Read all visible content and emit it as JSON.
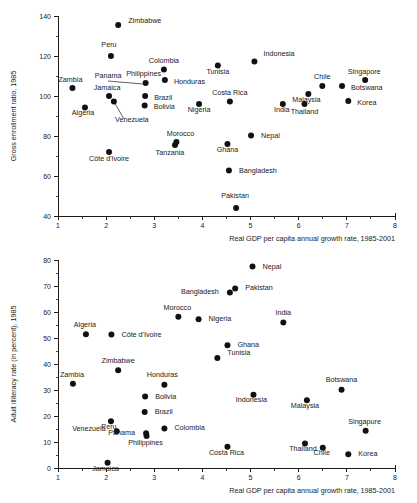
{
  "figure": {
    "background": "#ffffff",
    "marker_color": "#111111",
    "axis_color": "#1a1a1a"
  },
  "chart_data": [
    {
      "id": "top",
      "type": "scatter",
      "title": "",
      "xlabel": "Real GDP per capita annual growth rate, 1985-2001",
      "ylabel": "Gross enrollment ratio, 1985",
      "xlim": [
        1,
        8
      ],
      "ylim": [
        40,
        140
      ],
      "xticks": [
        1,
        2,
        3,
        4,
        5,
        6,
        7,
        8
      ],
      "yticks": [
        40,
        60,
        80,
        100,
        120,
        140
      ],
      "x_minor_step": 0.5,
      "y_minor_step": 10,
      "grid": false,
      "legend": "none",
      "points": [
        {
          "label": "Zimbabwe",
          "x": 2.25,
          "y": 135.5,
          "lx": 10,
          "ly": 2.5
        },
        {
          "label": "Peru",
          "x": 2.1,
          "y": 120.0,
          "lx": -2,
          "ly": 9.0,
          "anchor": "middle"
        },
        {
          "label": "Indonesia",
          "x": 5.08,
          "y": 117.3,
          "lx": 9,
          "ly": 5.0
        },
        {
          "label": "Colombia",
          "x": 3.2,
          "y": 113.2,
          "lx": 0,
          "ly": 7.0,
          "anchor": "middle"
        },
        {
          "label": "Tunisia",
          "x": 4.32,
          "y": 115.3,
          "lx": 0,
          "ly": -8.5,
          "anchor": "middle"
        },
        {
          "label": "Singapore",
          "x": 7.38,
          "y": 108.0,
          "lx": -1,
          "ly": 6.5,
          "anchor": "middle"
        },
        {
          "label": "Philippines",
          "x": 2.82,
          "y": 106.5,
          "lx": -2,
          "ly": 7.0,
          "anchor": "middle"
        },
        {
          "label": "Honduras",
          "x": 3.22,
          "y": 108.0,
          "lx": 9,
          "ly": -4.0
        },
        {
          "label": "Chile",
          "x": 6.49,
          "y": 105.0,
          "lx": 0,
          "ly": 7.0,
          "anchor": "middle"
        },
        {
          "label": "Botswana",
          "x": 6.9,
          "y": 105.0,
          "lx": 9,
          "ly": -4.0
        },
        {
          "label": "Zambia",
          "x": 1.3,
          "y": 104.0,
          "lx": -2,
          "ly": 6.5,
          "anchor": "middle"
        },
        {
          "label": "Malaysia",
          "x": 6.2,
          "y": 101.0,
          "lx": -2,
          "ly": -7.5,
          "anchor": "middle"
        },
        {
          "label": "Jamaica",
          "x": 2.06,
          "y": 100.0,
          "lx": -2,
          "ly": 6.5,
          "anchor": "middle"
        },
        {
          "label": "Brazil",
          "x": 2.81,
          "y": 100.0,
          "lx": 9,
          "ly": -3.5
        },
        {
          "label": "Korea",
          "x": 7.03,
          "y": 97.5,
          "lx": 9,
          "ly": -3.5
        },
        {
          "label": "Costa Rica",
          "x": 4.57,
          "y": 97.3,
          "lx": 0,
          "ly": 6.5,
          "anchor": "middle"
        },
        {
          "label": "Venezuela",
          "x": 2.16,
          "y": 97.2,
          "lx": 18,
          "ly": -20.0,
          "anchor": "middle",
          "leader": true
        },
        {
          "label": "Nigeria",
          "x": 3.93,
          "y": 96.0,
          "lx": 0,
          "ly": -7.5,
          "anchor": "middle"
        },
        {
          "label": "India",
          "x": 5.67,
          "y": 96.0,
          "lx": -1,
          "ly": -7.5,
          "anchor": "middle"
        },
        {
          "label": "Thailand",
          "x": 6.12,
          "y": 96.0,
          "lx": 0,
          "ly": -9.5,
          "anchor": "middle"
        },
        {
          "label": "Bolivia",
          "x": 2.8,
          "y": 95.2,
          "lx": 9,
          "ly": -3.5
        },
        {
          "label": "Algeria",
          "x": 1.56,
          "y": 94.2,
          "lx": -2,
          "ly": -7.5,
          "anchor": "middle"
        },
        {
          "label": "Nepal",
          "x": 5.01,
          "y": 80.3,
          "lx": 10,
          "ly": -2.5
        },
        {
          "label": "Morocco",
          "x": 3.46,
          "y": 77.0,
          "lx": 4,
          "ly": 6.5,
          "anchor": "middle"
        },
        {
          "label": "Ghana",
          "x": 4.52,
          "y": 76.0,
          "lx": 0,
          "ly": -8.0,
          "anchor": "middle"
        },
        {
          "label": "Tanzania",
          "x": 3.43,
          "y": 75.5,
          "lx": -5,
          "ly": -9.5,
          "anchor": "middle"
        },
        {
          "label": "Côte d'Ivoire",
          "x": 2.06,
          "y": 72.0,
          "lx": 0,
          "ly": -9.0,
          "anchor": "middle"
        },
        {
          "label": "Bangladesh",
          "x": 4.55,
          "y": 62.7,
          "lx": 10,
          "ly": -2.5
        },
        {
          "label": "Pakistan",
          "x": 4.7,
          "y": 44.0,
          "lx": -1,
          "ly": 10.0,
          "anchor": "middle"
        }
      ],
      "panama_leader": {
        "from_x": 2.04,
        "from_y": 107.5,
        "to_x": 2.76,
        "to_y": 106.0
      }
    },
    {
      "id": "bottom",
      "type": "scatter",
      "title": "",
      "xlabel": "Real GDP per capita annual growth rate, 1985-2001",
      "ylabel": "Adult illiteracy rate (in percent), 1985",
      "xlim": [
        1,
        8
      ],
      "ylim": [
        0,
        80
      ],
      "xticks": [
        1,
        2,
        3,
        4,
        5,
        6,
        7,
        8
      ],
      "yticks": [
        0,
        10,
        20,
        30,
        40,
        50,
        60,
        70,
        80
      ],
      "x_minor_step": 0.5,
      "y_minor_step": 5,
      "grid": false,
      "legend": "none",
      "points": [
        {
          "label": "Nepal",
          "x": 5.04,
          "y": 77.5,
          "lx": 10,
          "ly": -2.5
        },
        {
          "label": "Pakistan",
          "x": 4.68,
          "y": 69.0,
          "lx": 10,
          "ly": -1.5
        },
        {
          "label": "Bangladesh",
          "x": 4.57,
          "y": 67.5,
          "lx": -11,
          "ly": -1.0,
          "anchor": "end"
        },
        {
          "label": "Morocco",
          "x": 3.5,
          "y": 58.2,
          "lx": -1,
          "ly": 6.5,
          "anchor": "middle"
        },
        {
          "label": "Nigeria",
          "x": 3.92,
          "y": 57.2,
          "lx": 10,
          "ly": -2.0
        },
        {
          "label": "India",
          "x": 5.68,
          "y": 56.0,
          "lx": 0,
          "ly": 7.5,
          "anchor": "middle"
        },
        {
          "label": "Algeria",
          "x": 1.58,
          "y": 51.4,
          "lx": -1,
          "ly": 7.0,
          "anchor": "middle"
        },
        {
          "label": "Côte d'Ivoire",
          "x": 2.11,
          "y": 51.3,
          "lx": 10,
          "ly": -2.0
        },
        {
          "label": "Ghana",
          "x": 4.52,
          "y": 47.2,
          "lx": 10,
          "ly": -2.0
        },
        {
          "label": "Tunisia",
          "x": 4.31,
          "y": 42.3,
          "lx": 10,
          "ly": 3.5
        },
        {
          "label": "Zimbabwe",
          "x": 2.25,
          "y": 37.6,
          "lx": 0,
          "ly": 7.0,
          "anchor": "middle"
        },
        {
          "label": "Zambia",
          "x": 1.31,
          "y": 32.4,
          "lx": -1,
          "ly": 7.0,
          "anchor": "middle"
        },
        {
          "label": "Honduras",
          "x": 3.21,
          "y": 32.0,
          "lx": -2,
          "ly": 7.5,
          "anchor": "middle"
        },
        {
          "label": "Botswana",
          "x": 6.89,
          "y": 30.1,
          "lx": 0,
          "ly": 7.5,
          "anchor": "middle"
        },
        {
          "label": "Indonesia",
          "x": 5.06,
          "y": 28.2,
          "lx": -2,
          "ly": -7.5,
          "anchor": "middle"
        },
        {
          "label": "Bolivia",
          "x": 2.81,
          "y": 27.5,
          "lx": 10,
          "ly": -2.0
        },
        {
          "label": "Malaysia",
          "x": 6.17,
          "y": 26.1,
          "lx": -2,
          "ly": -7.5,
          "anchor": "middle"
        },
        {
          "label": "Brazil",
          "x": 2.8,
          "y": 21.5,
          "lx": 10,
          "ly": -2.0
        },
        {
          "label": "Peru",
          "x": 2.1,
          "y": 18.0,
          "lx": -2,
          "ly": -7.5,
          "anchor": "middle"
        },
        {
          "label": "Colombia",
          "x": 3.21,
          "y": 15.2,
          "lx": 10,
          "ly": -2.0
        },
        {
          "label": "Singapure",
          "x": 7.39,
          "y": 14.3,
          "lx": -1,
          "ly": 7.0,
          "anchor": "middle"
        },
        {
          "label": "Venezuela",
          "x": 2.22,
          "y": 14.1,
          "lx": -11,
          "ly": 0.0,
          "anchor": "end"
        },
        {
          "label": "Panama",
          "x": 2.83,
          "y": 13.4,
          "lx": -11,
          "ly": -1.5,
          "anchor": "end"
        },
        {
          "label": "Philippines",
          "x": 2.84,
          "y": 12.3,
          "lx": -1,
          "ly": -8.5,
          "anchor": "middle"
        },
        {
          "label": "Thailand",
          "x": 6.13,
          "y": 9.4,
          "lx": -2,
          "ly": -7.5,
          "anchor": "middle"
        },
        {
          "label": "Costa Rica",
          "x": 4.52,
          "y": 8.2,
          "lx": -1,
          "ly": -8.0,
          "anchor": "middle"
        },
        {
          "label": "Chile",
          "x": 6.5,
          "y": 7.8,
          "lx": -1,
          "ly": -7.5,
          "anchor": "middle"
        },
        {
          "label": "Korea",
          "x": 7.03,
          "y": 5.3,
          "lx": 10,
          "ly": -2.0
        },
        {
          "label": "Jamaica",
          "x": 2.03,
          "y": 2.0,
          "lx": -2,
          "ly": -8.0,
          "anchor": "middle"
        }
      ]
    }
  ],
  "panel_top": {
    "ylabel": "Gross enrollment ratio, 1985",
    "xlabel": "Real GDP per capita annual growth rate, 1985-2001",
    "panama_label": "Panama"
  },
  "panel_bottom": {
    "ylabel": "Adult illiteracy rate (in percent), 1985",
    "xlabel": "Real GDP per capita annual growth rate, 1985-2001"
  }
}
